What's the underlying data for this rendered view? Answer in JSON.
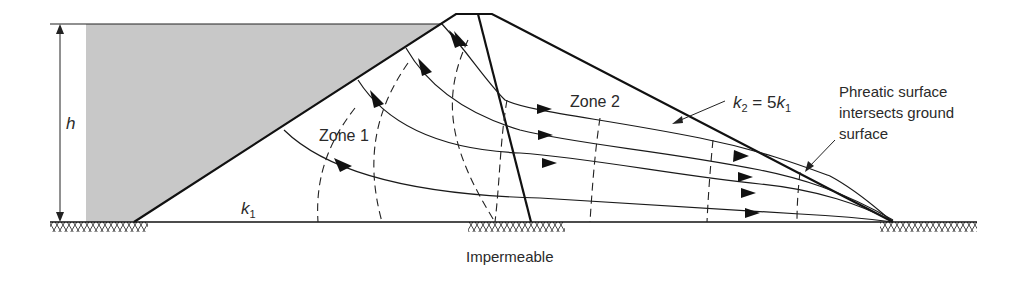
{
  "diagram": {
    "labels": {
      "height": "h",
      "zone1": "Zone 1",
      "zone2": "Zone 2",
      "k1_base": "k",
      "k1_sub": "1",
      "k2_k": "k",
      "k2_sub": "2",
      "k2_eq": " = 5",
      "k2_k1": "k",
      "k2_k1_sub": "1",
      "phreatic_line1": "Phreatic surface",
      "phreatic_line2": "intersects ground",
      "phreatic_line3": "surface",
      "impermeable": "Impermeable"
    },
    "colors": {
      "water": "#c8c8c8",
      "line": "#1a1a1a",
      "text": "#2a2a2a"
    },
    "elements": {
      "reservoir": "upstream water, height h",
      "zone1": "upstream zone, permeability k1",
      "zone2": "downstream zone, permeability k2 = 5k1",
      "flow_lines": 4,
      "equipotential_lines": 7
    }
  }
}
